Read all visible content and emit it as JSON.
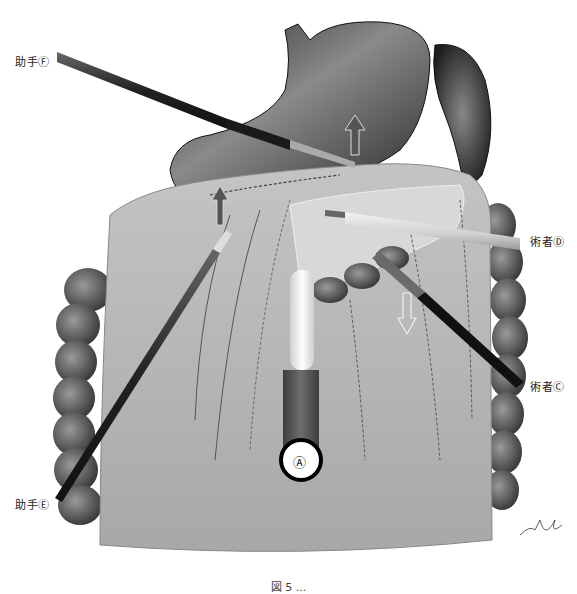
{
  "figure": {
    "labels": {
      "assistant_f": "助手Ⓕ",
      "assistant_e": "助手Ⓔ",
      "surgeon_d": "術者Ⓓ",
      "surgeon_c": "術者Ⓒ",
      "port_a": "Ⓐ"
    },
    "caption": "図 5  ..."
  },
  "colors": {
    "stomach": "#3a3a3a",
    "omentum": "#b8b8b8",
    "colon": "#4a4a4a",
    "instrument_dark": "#1a1a1a",
    "instrument_light": "#d8d8d8",
    "port_red": "#555555"
  }
}
